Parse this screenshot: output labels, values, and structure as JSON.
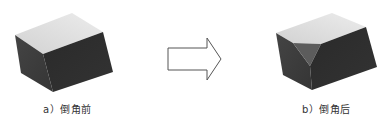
{
  "captions": {
    "before": "a）倒角前",
    "after": "b）倒角后"
  },
  "colors": {
    "top_face": "#dcdcdc",
    "top_face_light": "#ebebeb",
    "left_face": "#3c3c3c",
    "front_face": "#2e2e2e",
    "chamfer_face": "#5c5c5c",
    "arrow_stroke": "#555555",
    "arrow_fill": "#ffffff"
  },
  "shapes": {
    "box_before": "block",
    "arrow": "right-arrow",
    "box_after": "chamfered-block"
  }
}
